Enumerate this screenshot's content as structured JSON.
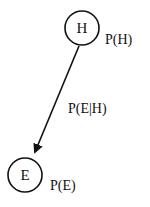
{
  "diagram": {
    "type": "bayesian-network",
    "nodes": [
      {
        "id": "H",
        "label": "H",
        "probability_label": "P(H)"
      },
      {
        "id": "E",
        "label": "E",
        "probability_label": "P(E)"
      }
    ],
    "edges": [
      {
        "from": "H",
        "to": "E",
        "label": "P(E|H)"
      }
    ]
  },
  "colors": {
    "stroke": "#111111",
    "background": "#ffffff"
  }
}
